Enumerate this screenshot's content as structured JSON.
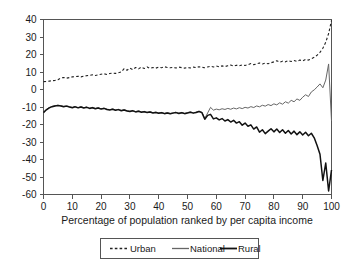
{
  "chart_data": {
    "type": "line",
    "title": "",
    "xlabel": "Percentage of population ranked by per capita income",
    "ylabel": "",
    "xlim": [
      0,
      100
    ],
    "ylim": [
      -60,
      40
    ],
    "grid": false,
    "legend_position": "bottom",
    "xticks": [
      0,
      10,
      20,
      30,
      40,
      50,
      60,
      70,
      80,
      90,
      100
    ],
    "yticks": [
      40,
      30,
      20,
      10,
      0,
      -10,
      -20,
      -30,
      -40,
      -50,
      -60
    ],
    "xtick_labels": [
      "0",
      "10",
      "20",
      "30",
      "40",
      "50",
      "60",
      "70",
      "80",
      "90",
      "100"
    ],
    "ytick_labels": [
      "40",
      "30",
      "20",
      "10",
      "0",
      "-10",
      "-20",
      "-30",
      "-40",
      "-50",
      "-60"
    ],
    "series": [
      {
        "name": "Urban",
        "style": "dashed",
        "color": "#222222",
        "width": 1.1,
        "x": [
          0,
          1,
          2,
          3,
          4,
          5,
          6,
          7,
          8,
          9,
          10,
          11,
          12,
          13,
          14,
          15,
          16,
          17,
          18,
          19,
          20,
          21,
          22,
          23,
          24,
          25,
          26,
          27,
          28,
          29,
          30,
          31,
          32,
          33,
          34,
          35,
          36,
          37,
          38,
          39,
          40,
          41,
          42,
          43,
          44,
          45,
          46,
          47,
          48,
          49,
          50,
          51,
          52,
          53,
          54,
          55,
          56,
          57,
          58,
          59,
          60,
          61,
          62,
          63,
          64,
          65,
          66,
          67,
          68,
          69,
          70,
          71,
          72,
          73,
          74,
          75,
          76,
          77,
          78,
          79,
          80,
          81,
          82,
          83,
          84,
          85,
          86,
          87,
          88,
          89,
          90,
          91,
          92,
          93,
          94,
          95,
          96,
          97,
          98,
          99,
          100
        ],
        "values": [
          4.5,
          4.6,
          4.8,
          5.0,
          5.2,
          5.6,
          6.6,
          6.9,
          6.5,
          6.8,
          7.2,
          7.4,
          7.6,
          7.2,
          7.6,
          7.9,
          8.1,
          8.4,
          8.0,
          8.4,
          8.7,
          9.0,
          8.6,
          9.1,
          9.4,
          9.2,
          9.6,
          10.0,
          11.9,
          11.0,
          12.2,
          11.4,
          12.6,
          11.8,
          12.8,
          12.0,
          12.9,
          12.1,
          12.6,
          12.2,
          12.8,
          12.4,
          13.0,
          12.6,
          12.4,
          12.7,
          12.3,
          12.8,
          12.5,
          12.2,
          12.6,
          12.3,
          12.8,
          12.5,
          13.0,
          12.7,
          12.4,
          12.9,
          13.3,
          12.9,
          13.4,
          13.0,
          13.5,
          13.1,
          13.6,
          14.0,
          13.4,
          13.9,
          13.5,
          14.1,
          13.7,
          14.2,
          14.8,
          14.2,
          14.6,
          15.2,
          14.6,
          15.1,
          14.7,
          15.3,
          15.8,
          16.4,
          15.6,
          16.2,
          15.8,
          16.5,
          16.0,
          16.6,
          16.1,
          16.8,
          16.4,
          17.2,
          16.8,
          17.6,
          18.4,
          19.6,
          21.2,
          23.6,
          27.0,
          32.0,
          39.5
        ]
      },
      {
        "name": "National",
        "style": "solid",
        "color": "#666666",
        "width": 1.0,
        "x": [
          0,
          1,
          2,
          3,
          4,
          5,
          6,
          7,
          8,
          9,
          10,
          11,
          12,
          13,
          14,
          15,
          16,
          17,
          18,
          19,
          20,
          21,
          22,
          23,
          24,
          25,
          26,
          27,
          28,
          29,
          30,
          31,
          32,
          33,
          34,
          35,
          36,
          37,
          38,
          39,
          40,
          41,
          42,
          43,
          44,
          45,
          46,
          47,
          48,
          49,
          50,
          51,
          52,
          53,
          54,
          55,
          56,
          57,
          58,
          59,
          60,
          61,
          62,
          63,
          64,
          65,
          66,
          67,
          68,
          69,
          70,
          71,
          72,
          73,
          74,
          75,
          76,
          77,
          78,
          79,
          80,
          81,
          82,
          83,
          84,
          85,
          86,
          87,
          88,
          89,
          90,
          91,
          92,
          93,
          94,
          95,
          96,
          97,
          98,
          99,
          100
        ],
        "values": [
          -13.0,
          -11.4,
          -10.3,
          -9.6,
          -9.2,
          -9.0,
          -9.2,
          -9.6,
          -9.3,
          -9.8,
          -10.2,
          -9.7,
          -10.3,
          -9.8,
          -10.4,
          -10.0,
          -10.6,
          -10.2,
          -10.8,
          -10.4,
          -11.0,
          -10.6,
          -11.2,
          -11.5,
          -11.1,
          -11.7,
          -11.3,
          -11.9,
          -11.5,
          -12.1,
          -12.4,
          -12.0,
          -12.6,
          -12.2,
          -12.8,
          -12.5,
          -13.0,
          -12.7,
          -13.2,
          -12.9,
          -13.4,
          -13.1,
          -13.6,
          -13.2,
          -13.7,
          -13.3,
          -13.0,
          -13.5,
          -13.1,
          -13.6,
          -13.2,
          -12.8,
          -13.3,
          -12.9,
          -12.4,
          -13.0,
          -16.5,
          -13.4,
          -10.2,
          -11.8,
          -11.2,
          -11.6,
          -11.0,
          -11.4,
          -10.8,
          -11.3,
          -10.6,
          -11.1,
          -10.4,
          -10.9,
          -10.2,
          -10.6,
          -9.8,
          -10.3,
          -9.4,
          -9.9,
          -9.0,
          -9.5,
          -8.6,
          -9.2,
          -8.2,
          -8.8,
          -7.6,
          -8.4,
          -7.0,
          -7.8,
          -6.2,
          -7.0,
          -5.4,
          -6.2,
          -4.4,
          -3.0,
          -4.0,
          -1.4,
          -0.2,
          1.4,
          3.2,
          1.0,
          5.4,
          14.6,
          -18.0
        ]
      },
      {
        "name": "Rural",
        "style": "solid",
        "color": "#111111",
        "width": 1.5,
        "x": [
          0,
          1,
          2,
          3,
          4,
          5,
          6,
          7,
          8,
          9,
          10,
          11,
          12,
          13,
          14,
          15,
          16,
          17,
          18,
          19,
          20,
          21,
          22,
          23,
          24,
          25,
          26,
          27,
          28,
          29,
          30,
          31,
          32,
          33,
          34,
          35,
          36,
          37,
          38,
          39,
          40,
          41,
          42,
          43,
          44,
          45,
          46,
          47,
          48,
          49,
          50,
          51,
          52,
          53,
          54,
          55,
          56,
          57,
          58,
          59,
          60,
          61,
          62,
          63,
          64,
          65,
          66,
          67,
          68,
          69,
          70,
          71,
          72,
          73,
          74,
          75,
          76,
          77,
          78,
          79,
          80,
          81,
          82,
          83,
          84,
          85,
          86,
          87,
          88,
          89,
          90,
          91,
          92,
          93,
          94,
          95,
          96,
          97,
          98,
          99,
          100
        ],
        "values": [
          -13.2,
          -11.6,
          -10.5,
          -9.8,
          -9.4,
          -9.2,
          -9.4,
          -9.8,
          -9.5,
          -10.0,
          -10.4,
          -9.9,
          -10.5,
          -10.0,
          -10.6,
          -10.2,
          -10.8,
          -10.4,
          -11.0,
          -10.6,
          -11.2,
          -10.8,
          -11.4,
          -11.7,
          -11.3,
          -11.9,
          -11.5,
          -12.1,
          -11.7,
          -12.3,
          -12.6,
          -12.2,
          -12.8,
          -12.4,
          -13.0,
          -12.7,
          -13.2,
          -12.9,
          -13.4,
          -13.1,
          -13.6,
          -13.3,
          -13.8,
          -13.4,
          -13.9,
          -13.5,
          -13.2,
          -13.7,
          -13.3,
          -13.8,
          -13.4,
          -13.0,
          -13.5,
          -13.1,
          -12.6,
          -13.2,
          -17.0,
          -14.8,
          -14.2,
          -16.8,
          -16.2,
          -17.4,
          -16.6,
          -18.0,
          -17.2,
          -18.6,
          -17.6,
          -19.2,
          -18.4,
          -20.4,
          -19.2,
          -21.0,
          -20.2,
          -22.6,
          -21.4,
          -24.4,
          -23.0,
          -25.2,
          -23.8,
          -22.4,
          -24.2,
          -22.6,
          -24.6,
          -23.0,
          -25.0,
          -23.4,
          -25.4,
          -23.8,
          -25.8,
          -24.2,
          -26.0,
          -24.4,
          -26.4,
          -25.0,
          -27.6,
          -32.0,
          -37.0,
          -52.0,
          -42.0,
          -58.0,
          -46.0
        ]
      }
    ]
  },
  "legend": {
    "items": [
      {
        "label": "Urban",
        "style": "dashed"
      },
      {
        "label": "National",
        "style": "solid-thin"
      },
      {
        "label": "Rural",
        "style": "solid-thick"
      }
    ]
  }
}
